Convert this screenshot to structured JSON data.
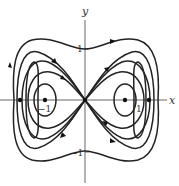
{
  "figure": {
    "type": "phase-portrait",
    "axes": {
      "x_label": "x",
      "y_label": "y",
      "y_ticks": [
        {
          "label": "1",
          "value": 1
        },
        {
          "label": "−1",
          "value": -1
        }
      ],
      "x_ticks": [
        {
          "label": "−1",
          "value": -1
        },
        {
          "label": "1",
          "value": 1
        }
      ]
    },
    "equilibria": [
      {
        "x": -1.6,
        "y": 0,
        "kind": "point"
      },
      {
        "x": -1,
        "y": 0,
        "kind": "center"
      },
      {
        "x": 0,
        "y": 0,
        "kind": "saddle"
      },
      {
        "x": 1,
        "y": 0,
        "kind": "center"
      },
      {
        "x": 1.6,
        "y": 0,
        "kind": "point"
      }
    ],
    "colors": {
      "curve": "#222222",
      "axis": "#555555",
      "background": "#ffffff"
    }
  }
}
